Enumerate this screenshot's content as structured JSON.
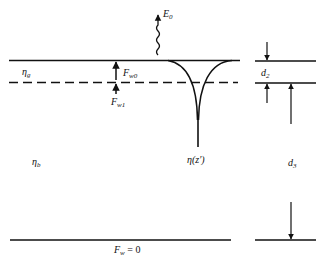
{
  "diagram": {
    "labels": {
      "emission": "E",
      "emission_sub": "0",
      "eta_g": "η",
      "eta_g_sub": "g",
      "eta_b": "η",
      "eta_b_sub": "b",
      "fw0": "F",
      "fw0_sub": "w0",
      "fw1": "F",
      "fw1_sub": "w1",
      "eta_z": "η(z′)",
      "d2": "d",
      "d2_sub": "2",
      "d3": "d",
      "d3_sub": "3",
      "fw_zero": "F",
      "fw_zero_sub": "w",
      "fw_zero_rest": " = 0"
    },
    "colors": {
      "line": "#111111",
      "background": "#ffffff"
    }
  }
}
